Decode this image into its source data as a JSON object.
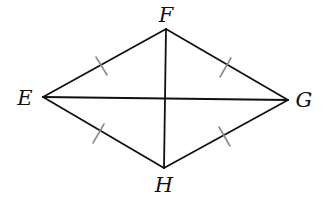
{
  "figure": {
    "type": "rhombus",
    "name": "EFGH",
    "vertices": [
      {
        "id": "E",
        "label": "E",
        "x": 43,
        "y": 97,
        "label_x": 25,
        "label_y": 98
      },
      {
        "id": "F",
        "label": "F",
        "x": 166,
        "y": 29,
        "label_x": 166,
        "label_y": 15
      },
      {
        "id": "G",
        "label": "G",
        "x": 288,
        "y": 100,
        "label_x": 304,
        "label_y": 100
      },
      {
        "id": "H",
        "label": "H",
        "x": 164,
        "y": 168,
        "label_x": 164,
        "label_y": 185
      }
    ],
    "sides": [
      {
        "from": "E",
        "to": "F",
        "tick_marks": 1
      },
      {
        "from": "F",
        "to": "G",
        "tick_marks": 1
      },
      {
        "from": "G",
        "to": "H",
        "tick_marks": 1
      },
      {
        "from": "H",
        "to": "E",
        "tick_marks": 1
      }
    ],
    "diagonals": [
      {
        "from": "E",
        "to": "G"
      },
      {
        "from": "F",
        "to": "H"
      }
    ],
    "intersection": {
      "x": 165,
      "y": 98
    },
    "colors": {
      "line": "#111111",
      "tick": "#8a8a8a",
      "background": "#ffffff"
    }
  },
  "labels": {
    "E": "E",
    "F": "F",
    "G": "G",
    "H": "H"
  }
}
